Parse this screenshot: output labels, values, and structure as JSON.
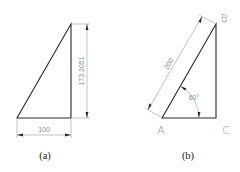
{
  "figure_a": {
    "caption": "(a)",
    "dimensions": {
      "horizontal": "100",
      "vertical": "173.2051"
    }
  },
  "figure_b": {
    "caption": "(b)",
    "vertices": {
      "a": "A",
      "b": "B",
      "c": "C"
    },
    "dimensions": {
      "hypotenuse": "200",
      "angle": "60°"
    }
  },
  "colors": {
    "edge": "#2a2a2a",
    "dimension": "#9a9a9a",
    "label": "#9a9a9a",
    "background": "#ffffff"
  }
}
